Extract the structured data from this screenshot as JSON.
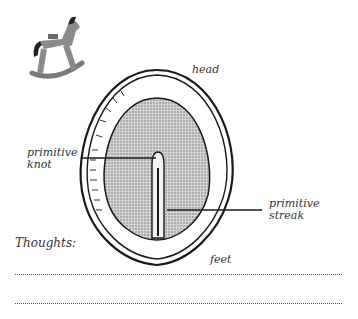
{
  "diagram": {
    "labels": {
      "head": "head",
      "primitive_knot_1": "primitive",
      "primitive_knot_2": "knot",
      "primitive_streak_1": "primitive",
      "primitive_streak_2": "streak",
      "feet": "feet"
    },
    "icon": "rocking-horse-icon"
  },
  "notes": {
    "label": "Thoughts:",
    "lines": 2
  },
  "colors": {
    "line": "#1a1a1a",
    "shade": "#b8b8b8",
    "horse_body": "#8a8a8a",
    "horse_mane": "#222222"
  }
}
